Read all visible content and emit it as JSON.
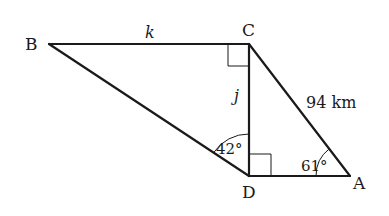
{
  "diagram": {
    "type": "geometry-figure",
    "vertices": [
      {
        "name": "B",
        "x": 49,
        "y": 44
      },
      {
        "name": "C",
        "x": 249,
        "y": 44
      },
      {
        "name": "D",
        "x": 249,
        "y": 176
      },
      {
        "name": "A",
        "x": 350,
        "y": 176
      }
    ],
    "labels": {
      "B": "B",
      "C": "C",
      "D": "D",
      "A": "A",
      "side_BC": "k",
      "side_CD": "j",
      "side_CA": "94 km",
      "angle_D": "42°",
      "angle_A": "61°"
    },
    "right_angles": [
      "BCD",
      "CDA"
    ],
    "stroke_color": "#1a1a1a"
  }
}
